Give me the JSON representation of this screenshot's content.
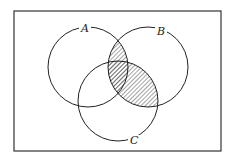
{
  "diagram": {
    "type": "venn",
    "shaded_region": "B ∩ (A ∪ C)",
    "frame": {
      "x": 14,
      "y": 11,
      "width": 207,
      "height": 140
    },
    "sets": [
      {
        "label": "A",
        "cx": 88,
        "cy": 67,
        "r": 40,
        "label_x": 85,
        "label_y": 32
      },
      {
        "label": "B",
        "cx": 148,
        "cy": 67,
        "r": 40,
        "label_x": 160,
        "label_y": 35
      },
      {
        "label": "C",
        "cx": 118,
        "cy": 101,
        "r": 40,
        "label_x": 133,
        "label_y": 144
      }
    ],
    "colors": {
      "stroke": "#222222",
      "hatch": "#333333",
      "background": "#ffffff"
    }
  }
}
